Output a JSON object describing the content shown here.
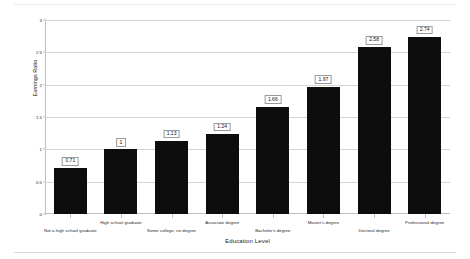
{
  "chart_data": {
    "type": "bar",
    "title": "",
    "xlabel": "Education Level",
    "ylabel": "Earnings Ratio",
    "ylim": [
      0,
      3
    ],
    "ytick_labels": [
      "0",
      "0.5",
      "1",
      "1.5",
      "2",
      "2.5",
      "3"
    ],
    "ytick_values": [
      0,
      0.5,
      1,
      1.5,
      2,
      2.5,
      3
    ],
    "grid": true,
    "legend": "none",
    "bar_color": "#0d0d0d",
    "categories": [
      "Not a high school graduate",
      "High school graduate",
      "Some college, no degree",
      "Associate degree",
      "Bachelor's degree",
      "Master's degree",
      "Doctoral degree",
      "Professional degree"
    ],
    "values": [
      0.71,
      1,
      1.13,
      1.24,
      1.66,
      1.97,
      2.58,
      2.74
    ],
    "value_labels": [
      "0.71",
      "1",
      "1.13",
      "1.24",
      "1.66",
      "1.97",
      "2.58",
      "2.74"
    ],
    "label_rows": [
      "bot",
      "top",
      "bot",
      "top",
      "bot",
      "top",
      "bot",
      "top"
    ]
  }
}
